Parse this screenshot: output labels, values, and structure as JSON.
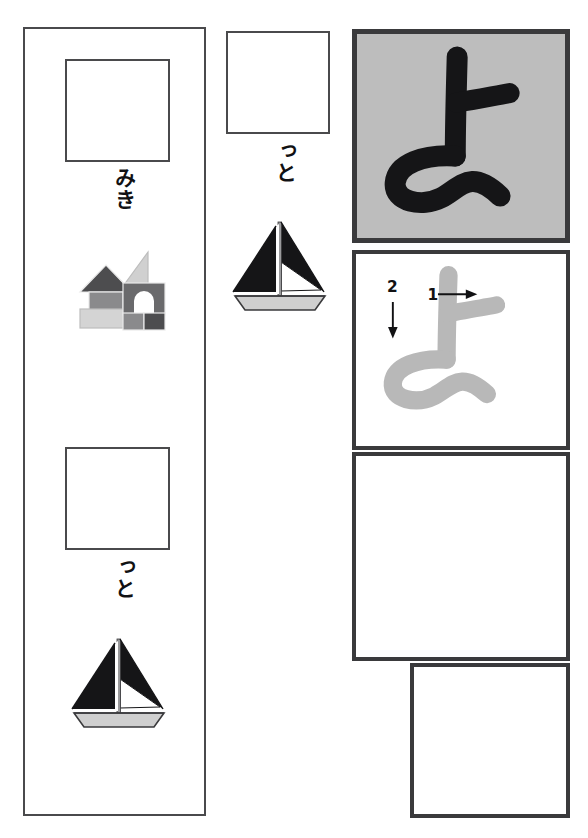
{
  "worksheet": {
    "title": "Hiragana practice worksheet",
    "target_kana": "よ",
    "target_romaji": "yo",
    "ink_color": "#111113",
    "border_color": "#3a3a3c",
    "guide_gray": "#bdbdbd",
    "stroke_guide_gray": "#b8b8b8"
  },
  "left_panel": {
    "name": "vocabulary-column",
    "entries": [
      {
        "id": "miki",
        "write_box_label": "",
        "kana": "みき",
        "illustration": "toy-blocks-icon",
        "illustration_label": "toy blocks"
      },
      {
        "id": "yotto-2",
        "write_box_label": "",
        "kana": "っと",
        "illustration": "sailboat-icon",
        "illustration_label": "sailboat"
      }
    ]
  },
  "middle_panel": {
    "name": "vocabulary-column-middle",
    "entries": [
      {
        "id": "yotto-1",
        "write_box_label": "",
        "kana": "っと",
        "illustration": "sailboat-icon",
        "illustration_label": "sailboat"
      }
    ]
  },
  "right_panel": {
    "name": "kana-reference-column",
    "hero": {
      "kana": "よ",
      "background": "#bdbdbd"
    },
    "stroke_order": {
      "kana": "よ",
      "guide_color": "#b8b8b8",
      "strokes": [
        {
          "number": "1",
          "direction": "right",
          "arrow": "→"
        },
        {
          "number": "2",
          "direction": "down",
          "arrow": "↓"
        }
      ]
    },
    "practice_boxes": [
      {
        "id": "practice-1",
        "content": ""
      },
      {
        "id": "practice-2",
        "content": ""
      }
    ]
  }
}
